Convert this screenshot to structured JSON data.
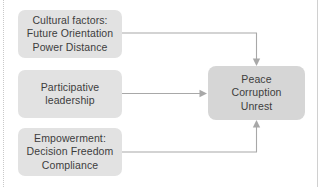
{
  "diagram": {
    "type": "flow-diagram",
    "background_color": "#ffffff",
    "node_fill": "#e2e2e2",
    "outcome_fill": "#d6d6d6",
    "connector_color": "#a8a8a8",
    "text_color": "#3d3d3d",
    "nodes": [
      {
        "id": "cultural",
        "name": "cultural-factors-node",
        "lines": [
          "Cultural factors:",
          "Future Orientation",
          "Power Distance"
        ]
      },
      {
        "id": "leadership",
        "name": "participative-leadership-node",
        "lines": [
          "Participative",
          "leadership"
        ]
      },
      {
        "id": "empowerment",
        "name": "empowerment-node",
        "lines": [
          "Empowerment:",
          "Decision Freedom",
          "Compliance"
        ]
      },
      {
        "id": "outcome",
        "name": "outcome-node",
        "lines": [
          "Peace",
          "Corruption",
          "Unrest"
        ]
      }
    ],
    "connectors": [
      {
        "id": "cultural-to-outcome",
        "from": "cultural",
        "to": "outcome",
        "route": "right-then-down",
        "arrowhead": "down"
      },
      {
        "id": "leadership-to-outcome",
        "from": "leadership",
        "to": "outcome",
        "route": "straight",
        "arrowhead": "right"
      },
      {
        "id": "empowerment-to-outcome",
        "from": "empowerment",
        "to": "outcome",
        "route": "right-then-up",
        "arrowhead": "up"
      }
    ]
  }
}
